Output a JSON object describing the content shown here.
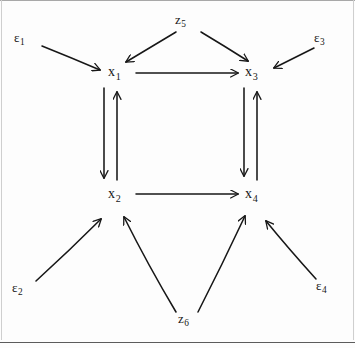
{
  "diagram": {
    "type": "causal-path-diagram",
    "background_color": "#fdfdfd",
    "ink_color": "#171717",
    "nodes": [
      {
        "id": "x1",
        "base": "x",
        "subscript": "1",
        "x": 116,
        "y": 74
      },
      {
        "id": "x3",
        "base": "x",
        "subscript": "3",
        "x": 253,
        "y": 74
      },
      {
        "id": "x2",
        "base": "x",
        "subscript": "2",
        "x": 116,
        "y": 196
      },
      {
        "id": "x4",
        "base": "x",
        "subscript": "4",
        "x": 253,
        "y": 196
      }
    ],
    "exogenous": [
      {
        "id": "e1",
        "base": "ε",
        "subscript": "1",
        "x": 20,
        "y": 40
      },
      {
        "id": "z5",
        "base": "z",
        "subscript": "5",
        "x": 180,
        "y": 22
      },
      {
        "id": "e3",
        "base": "ε",
        "subscript": "3",
        "x": 320,
        "y": 40
      },
      {
        "id": "e2",
        "base": "ε",
        "subscript": "2",
        "x": 18,
        "y": 290
      },
      {
        "id": "z6",
        "base": "z",
        "subscript": "6",
        "x": 183,
        "y": 320
      },
      {
        "id": "e4",
        "base": "ε",
        "subscript": "4",
        "x": 322,
        "y": 288
      }
    ],
    "edges": [
      {
        "from": "e1",
        "to": "x1",
        "kind": "single"
      },
      {
        "from": "e3",
        "to": "x3",
        "kind": "single"
      },
      {
        "from": "e2",
        "to": "x2",
        "kind": "single"
      },
      {
        "from": "e4",
        "to": "x4",
        "kind": "single"
      },
      {
        "from": "z5",
        "to": "x1",
        "kind": "single"
      },
      {
        "from": "z5",
        "to": "x3",
        "kind": "single"
      },
      {
        "from": "z6",
        "to": "x2",
        "kind": "single"
      },
      {
        "from": "z6",
        "to": "x4",
        "kind": "single"
      },
      {
        "from": "x1",
        "to": "x3",
        "kind": "single"
      },
      {
        "from": "x2",
        "to": "x4",
        "kind": "single"
      },
      {
        "from": "x1",
        "to": "x2",
        "kind": "single"
      },
      {
        "from": "x2",
        "to": "x1",
        "kind": "single"
      },
      {
        "from": "x3",
        "to": "x4",
        "kind": "single"
      },
      {
        "from": "x4",
        "to": "x3",
        "kind": "single"
      }
    ]
  }
}
